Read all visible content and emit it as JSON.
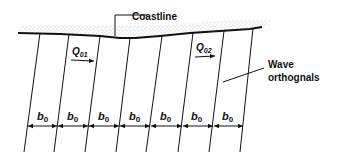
{
  "diagram": {
    "labels": {
      "coastline": "Coastline",
      "wave_line1": "Wave",
      "wave_line2": "orthognals",
      "q1_main": "Q",
      "q1_sub": "01",
      "q2_main": "Q",
      "q2_sub": "02",
      "b_main": "b",
      "b_sub": "0"
    },
    "colors": {
      "ink": "#111111",
      "sand": "#9a9a9a",
      "background": "#ffffff"
    },
    "orthogonal_count": 8,
    "spacing_count": 7
  }
}
